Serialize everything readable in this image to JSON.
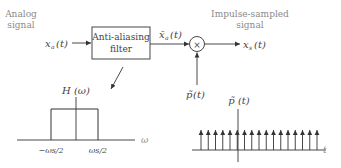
{
  "input": {
    "caption_line1": "Analog",
    "caption_line2": "signal",
    "signal": "x",
    "signal_sub": "a",
    "signal_arg": "(t)"
  },
  "filter": {
    "label_line1": "Anti-aliasing",
    "label_line2": "filter"
  },
  "filtered": {
    "signal": "x̄",
    "signal_sub": "a",
    "signal_arg": "(t)"
  },
  "multiplier": {
    "symbol": "×"
  },
  "sampling": {
    "signal": "p̃",
    "signal_arg": "(t)"
  },
  "output": {
    "caption_line1": "Impulse-sampled",
    "caption_line2": "signal",
    "signal": "x",
    "signal_sub": "s",
    "signal_arg": "(t)"
  },
  "filter_response": {
    "title": "H (ω)",
    "axis_label": "ω",
    "tick_left": "−ωs/2",
    "tick_right": "ωs/2"
  },
  "impulse_train": {
    "title": "p̃ (t)",
    "axis_label": "t",
    "impulse_count": 17
  },
  "colors": {
    "line": "#333333",
    "caption": "#8a8a8a"
  }
}
